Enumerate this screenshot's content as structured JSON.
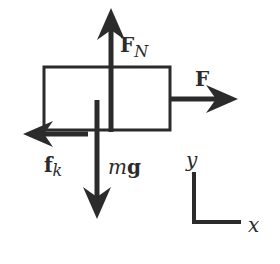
{
  "diagram": {
    "type": "free-body diagram",
    "colors": {
      "ink": "#2b2b2b",
      "background": "#ffffff"
    },
    "block": {
      "name": "block"
    },
    "forces": [
      {
        "id": "normal",
        "symbol": "F",
        "subscript": "N",
        "direction": "up"
      },
      {
        "id": "applied",
        "symbol": "F",
        "subscript": "",
        "direction": "right"
      },
      {
        "id": "friction",
        "symbol": "f",
        "subscript": "k",
        "direction": "left"
      },
      {
        "id": "weight",
        "symbol_italic": "m",
        "symbol_bold": "g",
        "direction": "down"
      }
    ],
    "axes": {
      "y_label": "y",
      "x_label": "x"
    }
  }
}
